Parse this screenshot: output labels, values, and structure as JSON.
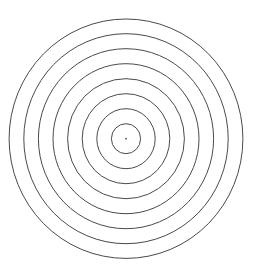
{
  "diagram": {
    "type": "concentric-circles",
    "background": "#ffffff",
    "stroke_color": "#4a4a4a",
    "stroke_width": 1,
    "center": {
      "x": 126,
      "y": 138.7
    },
    "ring_count": 8,
    "rings": [
      {
        "rx": 14.6,
        "ry": 15.0
      },
      {
        "rx": 29.2,
        "ry": 30.0
      },
      {
        "rx": 43.8,
        "ry": 45.0
      },
      {
        "rx": 58.4,
        "ry": 60.0
      },
      {
        "rx": 73.0,
        "ry": 75.0
      },
      {
        "rx": 87.6,
        "ry": 90.0
      },
      {
        "rx": 102.2,
        "ry": 105.0
      },
      {
        "rx": 116.9,
        "ry": 119.7
      }
    ],
    "center_dot": {
      "r": 0.9,
      "color": "#555555"
    }
  }
}
